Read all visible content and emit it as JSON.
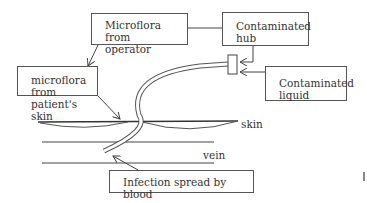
{
  "diagram": {
    "type": "catheter-infection-routes",
    "boxes": {
      "operator": {
        "line1": "Microflora from",
        "line2": "operator"
      },
      "hub": {
        "line1": "Contaminated",
        "line2": "hub"
      },
      "skin_flora": {
        "line1": "microflora",
        "line2": "from patient's",
        "line3": "skin"
      },
      "liquid": {
        "line1": "Contaminated",
        "line2": "liquid"
      },
      "blood": {
        "line1": "Infection spread by blood"
      }
    },
    "labels": {
      "skin": "skin",
      "vein": "vein"
    },
    "edges": [
      {
        "from": "operator",
        "to": "hub"
      },
      {
        "from": "operator",
        "to": "skin_flora"
      },
      {
        "from": "hub",
        "to": "catheter-hub"
      },
      {
        "from": "liquid",
        "to": "catheter-hub"
      },
      {
        "from": "skin_flora",
        "to": "insertion-site"
      },
      {
        "from": "blood",
        "to": "catheter-tip"
      }
    ]
  }
}
